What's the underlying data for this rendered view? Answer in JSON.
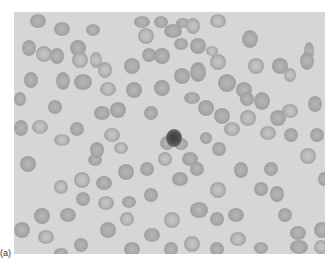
{
  "figure": {
    "panel_label": "(a)",
    "colors": {
      "background": "#d6d6d6",
      "cell": "#a5a5a5",
      "nucleated_cell": "#454545"
    }
  }
}
